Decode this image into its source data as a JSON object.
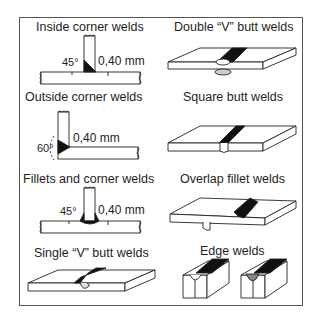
{
  "diagram": {
    "panels": [
      {
        "id": "inside-corner",
        "label": "Inside corner welds",
        "angle": "45°",
        "dimension": "0,40 mm"
      },
      {
        "id": "double-v-butt",
        "label": "Double “V” butt welds"
      },
      {
        "id": "outside-corner",
        "label": "Outside corner welds",
        "angle": "60°",
        "dimension": "0,40 mm"
      },
      {
        "id": "square-butt",
        "label": "Square butt welds"
      },
      {
        "id": "fillets-corner",
        "label": "Fillets and corner welds",
        "angle": "45°",
        "dimension": "0,40 mm"
      },
      {
        "id": "overlap-fillet",
        "label": "Overlap fillet welds"
      },
      {
        "id": "single-v-butt",
        "label": "Single “V” butt welds"
      },
      {
        "id": "edge",
        "label": "Edge welds"
      }
    ]
  }
}
